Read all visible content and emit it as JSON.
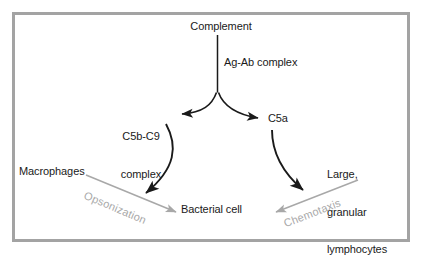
{
  "figure": {
    "type": "flow-diagram",
    "frame_color": "#a3a3a3",
    "background_color": "#ffffff",
    "text_color": "#1a1a1a",
    "process_label_color": "#a8a8a8"
  },
  "nodes": {
    "complement": "Complement",
    "ag_ab_complex": "Ag-Ab complex",
    "c5b_c9_complex_line1": "C5b-C9",
    "c5b_c9_complex_line2": "complex",
    "c5a": "C5a",
    "macrophages": "Macrophages",
    "large_granular_lymphocytes_line1": "Large,",
    "large_granular_lymphocytes_line2": "granular",
    "large_granular_lymphocytes_line3": "lymphocytes",
    "bacterial_cell": "Bacterial cell"
  },
  "processes": {
    "opsonization": "Opsonization",
    "chemotaxis": "Chemotaxis"
  },
  "edges": [
    {
      "from": "complement",
      "to": "fork",
      "style": "straight",
      "color": "#1a1a1a",
      "arrowhead": false
    },
    {
      "from": "fork",
      "to": "c5b_c9_complex",
      "style": "curved",
      "color": "#1a1a1a",
      "arrowhead": true
    },
    {
      "from": "fork",
      "to": "c5a",
      "style": "curved",
      "color": "#1a1a1a",
      "arrowhead": true
    },
    {
      "from": "c5b_c9_complex",
      "to": "bacterial_cell",
      "style": "curved",
      "color": "#1a1a1a",
      "arrowhead": true
    },
    {
      "from": "c5a",
      "to": "bacterial_cell",
      "style": "curved",
      "color": "#1a1a1a",
      "arrowhead": true
    },
    {
      "from": "macrophages",
      "to": "bacterial_cell",
      "style": "straight",
      "color": "#a8a8a8",
      "arrowhead": true,
      "label": "opsonization"
    },
    {
      "from": "large_granular_lymphocytes",
      "to": "bacterial_cell",
      "style": "straight",
      "color": "#a8a8a8",
      "arrowhead": true,
      "label": "chemotaxis"
    }
  ]
}
